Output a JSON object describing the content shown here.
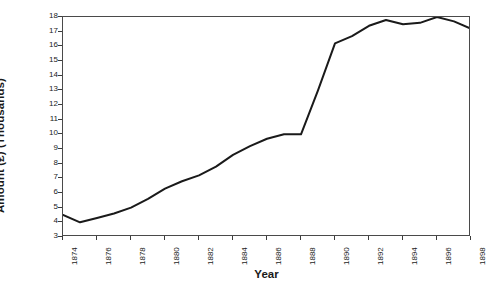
{
  "chart_data": {
    "type": "line",
    "title": "",
    "xlabel": "Year",
    "ylabel": "Amount (£) (Thousands)",
    "xlim": [
      1874,
      1898
    ],
    "ylim": [
      3,
      18
    ],
    "grid": false,
    "legend": false,
    "line_color": "#1a1a1a",
    "x_tick_labels": [
      "1874",
      "1876",
      "1878",
      "1880",
      "1882",
      "1884",
      "1886",
      "1888",
      "1890",
      "1892",
      "1894",
      "1896",
      "1898"
    ],
    "y_tick_labels": [
      "18",
      "17",
      "16",
      "15",
      "14",
      "13",
      "12",
      "11",
      "10",
      "9",
      "8",
      "7",
      "6",
      "5",
      "4",
      "3"
    ],
    "x": [
      1874,
      1875,
      1876,
      1877,
      1878,
      1879,
      1880,
      1881,
      1882,
      1883,
      1884,
      1885,
      1886,
      1887,
      1888,
      1889,
      1890,
      1891,
      1892,
      1893,
      1894,
      1895,
      1896,
      1897,
      1898
    ],
    "values": [
      4.5,
      4.0,
      4.3,
      4.6,
      5.0,
      5.6,
      6.3,
      6.8,
      7.2,
      7.8,
      8.6,
      9.2,
      9.7,
      10.0,
      10.0,
      13.0,
      16.2,
      16.7,
      17.4,
      17.8,
      17.5,
      17.6,
      18.0,
      17.7,
      17.2
    ],
    "series_name": "Amount"
  },
  "axes": {
    "y_title": "Amount (£) (Thousands)",
    "x_title": "Year"
  }
}
